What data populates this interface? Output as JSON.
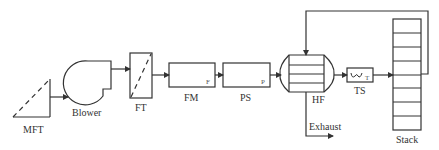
{
  "diagram": {
    "type": "process-flow",
    "line_color": "#333333",
    "background": "#ffffff",
    "components": [
      {
        "id": "mft",
        "label": "MFT"
      },
      {
        "id": "blower",
        "label": "Blower"
      },
      {
        "id": "ft",
        "label": "FT"
      },
      {
        "id": "fm",
        "label": "FM",
        "inner_label": "F"
      },
      {
        "id": "ps",
        "label": "PS",
        "inner_label": "P"
      },
      {
        "id": "hf",
        "label": "HF"
      },
      {
        "id": "ts",
        "label": "TS",
        "inner_label": "T"
      },
      {
        "id": "stack",
        "label": "Stack"
      }
    ],
    "exhaust_label": "Exhaust",
    "flows": [
      {
        "from": "mft",
        "to": "blower"
      },
      {
        "from": "blower",
        "to": "ft"
      },
      {
        "from": "ft",
        "to": "fm"
      },
      {
        "from": "fm",
        "to": "ps"
      },
      {
        "from": "ps",
        "to": "hf"
      },
      {
        "from": "hf",
        "to": "ts"
      },
      {
        "from": "ts",
        "to": "stack"
      },
      {
        "from": "stack",
        "to": "hf",
        "kind": "recirculation"
      },
      {
        "from": "hf",
        "to": "exhaust"
      }
    ]
  }
}
